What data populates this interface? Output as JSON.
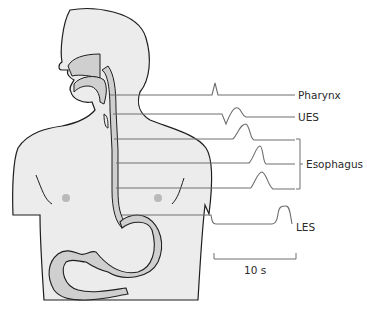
{
  "diagram": {
    "labels": {
      "pharynx": "Pharynx",
      "ues": "UES",
      "esophagus": "Esophagus",
      "les": "LES",
      "scale": "10 s"
    },
    "colors": {
      "body_fill": "#ececec",
      "tract_fill": "#cfcfcf",
      "outline": "#1e1e1e",
      "trace": "#6e6e6e",
      "nipple": "#b9b9b9"
    },
    "traces": [
      {
        "name": "pharynx",
        "y": 100,
        "event": "sharp spike",
        "peak_x": 215
      },
      {
        "name": "ues",
        "y": 117,
        "event": "dip then hump",
        "peak_x": 235
      },
      {
        "name": "esophagus-1",
        "y": 140,
        "event": "peristaltic wave",
        "peak_x": 242
      },
      {
        "name": "esophagus-2",
        "y": 164,
        "event": "peristaltic wave",
        "peak_x": 257
      },
      {
        "name": "esophagus-3",
        "y": 189,
        "event": "peristaltic wave",
        "peak_x": 263
      },
      {
        "name": "les",
        "y": 215,
        "event": "relaxation then contraction",
        "peak_x": 285
      }
    ]
  }
}
